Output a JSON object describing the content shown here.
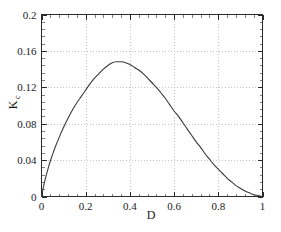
{
  "chart_data": {
    "type": "line",
    "title": "",
    "subtitle": "",
    "xlabel": "D",
    "ylabel": "K",
    "ylabel_subscript": "c",
    "ylabel_full": "Kc",
    "xlim": [
      0,
      1
    ],
    "ylim": [
      0,
      0.2
    ],
    "grid": true,
    "grid_style": "dotted",
    "legend": null,
    "legend_position": "none",
    "background_color": "#ffffff",
    "frame_color": "#2b2b2b",
    "curve_color": "#3a3a3a",
    "grid_color": "#b9b9b9",
    "xticks": [
      0,
      0.2,
      0.4,
      0.6,
      0.8,
      1
    ],
    "xtick_labels": [
      "0",
      "0.2",
      "0.4",
      "0.6",
      "0.8",
      "1"
    ],
    "yticks": [
      0,
      0.04,
      0.08,
      0.12,
      0.16,
      0.2
    ],
    "ytick_labels": [
      "0",
      "0.04",
      "0.08",
      "0.12",
      "0.16",
      "0.2"
    ],
    "x_minor_ticks_per_interval": 4,
    "y_minor_ticks_per_interval": 4,
    "peak": {
      "x": 0.34,
      "y": 0.148
    },
    "series": [
      {
        "name": "Kc",
        "x": [
          0.0,
          0.01,
          0.02,
          0.03,
          0.04,
          0.05,
          0.06,
          0.08,
          0.1,
          0.12,
          0.14,
          0.16,
          0.18,
          0.2,
          0.22,
          0.24,
          0.26,
          0.28,
          0.3,
          0.32,
          0.34,
          0.36,
          0.38,
          0.4,
          0.42,
          0.44,
          0.46,
          0.48,
          0.5,
          0.52,
          0.54,
          0.56,
          0.58,
          0.6,
          0.62,
          0.64,
          0.66,
          0.68,
          0.7,
          0.72,
          0.74,
          0.76,
          0.78,
          0.8,
          0.82,
          0.84,
          0.86,
          0.88,
          0.9,
          0.92,
          0.94,
          0.96,
          0.98,
          1.0
        ],
        "y": [
          0.0,
          0.012,
          0.022,
          0.031,
          0.039,
          0.046,
          0.053,
          0.065,
          0.076,
          0.086,
          0.095,
          0.103,
          0.11,
          0.117,
          0.124,
          0.13,
          0.135,
          0.14,
          0.144,
          0.147,
          0.148,
          0.148,
          0.147,
          0.145,
          0.142,
          0.139,
          0.135,
          0.13,
          0.125,
          0.12,
          0.114,
          0.108,
          0.101,
          0.094,
          0.088,
          0.081,
          0.074,
          0.067,
          0.06,
          0.054,
          0.047,
          0.041,
          0.035,
          0.03,
          0.025,
          0.02,
          0.016,
          0.012,
          0.009,
          0.006,
          0.004,
          0.002,
          0.001,
          0.0
        ]
      }
    ]
  },
  "axes": {
    "x_axis_label": "D",
    "y_axis_label": "K",
    "y_axis_sublabel": "c"
  }
}
